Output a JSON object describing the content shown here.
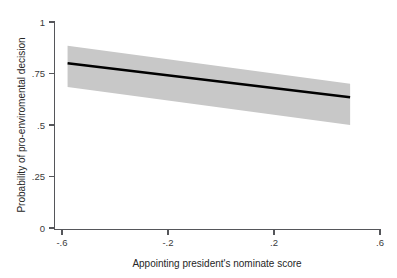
{
  "figure": {
    "background_color": "#ffffff",
    "cropped_title_text": ""
  },
  "chart_data": {
    "type": "line",
    "title": "",
    "subtitle": "",
    "xlabel": "Appointing president's nominate score",
    "ylabel": "Probability of pro-enviromental decision",
    "xlim": [
      -0.6,
      0.6
    ],
    "ylim": [
      0,
      1
    ],
    "grid": false,
    "legend": null,
    "xticks": [
      -0.6,
      -0.2,
      0.2,
      0.6
    ],
    "xticklabels": [
      "-.6",
      "-.2",
      ".2",
      ".6"
    ],
    "yticks": [
      0,
      0.25,
      0.5,
      0.75,
      1
    ],
    "yticklabels": [
      "0",
      ".25",
      ".5",
      ".75",
      "1"
    ],
    "series": [
      {
        "name": "Predicted probability",
        "kind": "line",
        "color": "#000000",
        "linewidth": 2.2,
        "x": [
          -0.55,
          0.49
        ],
        "values": [
          0.8,
          0.635
        ]
      },
      {
        "name": "95% confidence interval",
        "kind": "band",
        "color": "#c8c8c8",
        "x": [
          -0.55,
          0.49
        ],
        "lower": [
          0.685,
          0.5
        ],
        "upper": [
          0.885,
          0.7
        ]
      }
    ]
  },
  "axes": {
    "x_tick_values": [
      "-.6",
      "-.2",
      ".2",
      ".6"
    ],
    "y_tick_values": [
      "1",
      ".75",
      ".5",
      ".25",
      "0"
    ],
    "x_title": "Appointing president's nominate score",
    "y_title": "Probability of pro-enviromental decision",
    "axis_color": "#55565a"
  }
}
